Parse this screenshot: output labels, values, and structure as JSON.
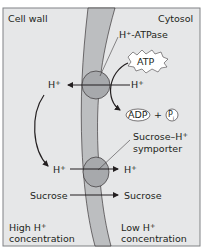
{
  "labels": {
    "cell_wall": "Cell wall",
    "cytosol": "Cytosol",
    "atpase": "H⁺-ATPase",
    "atp": "ATP",
    "h_left_top": "H",
    "h_right_top": "H",
    "adp": "ADP",
    "plus": "+",
    "pi": "P",
    "pi_sub": "i",
    "symporter_line1": "Sucrose–H",
    "symporter_line2": "symporter",
    "h_left_bottom": "H",
    "h_right_bottom": "H",
    "sucrose_left": "Sucrose",
    "sucrose_right": "Sucrose",
    "high_line1": "High H",
    "high_line2": "concentration",
    "low_line1": "Low H",
    "low_line2": "concentration",
    "plus_sup": "+"
  },
  "colors": {
    "background": "#e6e7e8",
    "membrane": "#bcbec0",
    "protein": "#a7a9ac",
    "line": "#231f20",
    "frame": "#808285"
  }
}
